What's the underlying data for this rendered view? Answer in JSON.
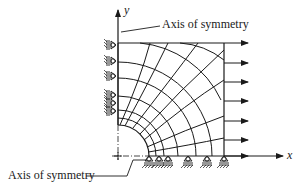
{
  "diagram": {
    "axes": {
      "x_label": "x",
      "y_label": "y"
    },
    "labels": {
      "top_symmetry": "Axis of symmetry",
      "bottom_symmetry": "Axis of symmetry"
    },
    "elements": {
      "left_edge_rollers": 6,
      "bottom_edge_rollers": 6,
      "load_arrows_right_edge": 7
    },
    "colors": {
      "line": "#1a1a1a",
      "background": "#ffffff"
    }
  }
}
